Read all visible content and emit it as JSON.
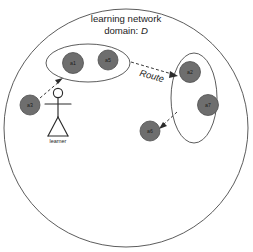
{
  "diagram": {
    "title_line1": "learning network",
    "title_line2_prefix": "domain: ",
    "title_line2_emphasis": "D",
    "route_label": "Route",
    "actor_label": "learner",
    "colors": {
      "node_fill": "#6e6e6e",
      "outline": "#4a4a4a",
      "arrow": "#3a3a3a",
      "text": "#1c1c1c",
      "background": "#ffffff"
    },
    "domain_boundary": {
      "name": "learning network domain",
      "cx": 126,
      "cy": 128,
      "rx": 122,
      "ry": 119
    },
    "clusters": [
      {
        "id": "cluster-left",
        "cx": 88,
        "cy": 63,
        "rx": 42,
        "ry": 19,
        "rotation": 0,
        "members": [
          "a1",
          "a5"
        ]
      },
      {
        "id": "cluster-right",
        "cx": 194,
        "cy": 98,
        "rx": 23,
        "ry": 45,
        "rotation": 0,
        "members": [
          "a2",
          "a7"
        ]
      }
    ],
    "nodes": [
      {
        "id": "a1",
        "label": "a1",
        "cx": 73,
        "cy": 63,
        "r": 10.5
      },
      {
        "id": "a5",
        "label": "a5",
        "cx": 108,
        "cy": 60,
        "r": 10.0
      },
      {
        "id": "a3",
        "label": "a3",
        "cx": 30,
        "cy": 105,
        "r": 10.0
      },
      {
        "id": "a2",
        "label": "a2",
        "cx": 190,
        "cy": 72,
        "r": 10.5
      },
      {
        "id": "a7",
        "label": "a7",
        "cx": 208,
        "cy": 105,
        "r": 10.5
      },
      {
        "id": "a6",
        "label": "a6",
        "cx": 150,
        "cy": 131,
        "r": 10.0
      }
    ],
    "arrows": [
      {
        "id": "arrow-a3-to-cluster-left",
        "from": "a3",
        "to": "cluster-left",
        "labelled": false
      },
      {
        "id": "arrow-cluster-left-to-a2",
        "from": "cluster-left",
        "to": "a2",
        "labelled": true,
        "label": "Route"
      },
      {
        "id": "arrow-a2-to-a6",
        "from": "a2",
        "to": "a6",
        "labelled": false
      }
    ],
    "actor": {
      "id": "learner",
      "label": "learner",
      "x": 58,
      "head_cy": 93
    }
  }
}
